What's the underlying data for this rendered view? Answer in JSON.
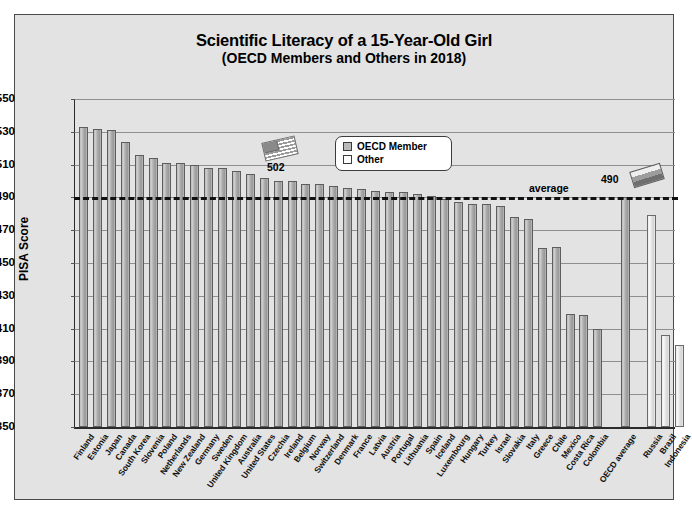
{
  "chart_data": {
    "type": "bar",
    "title": "Scientific Literacy of a 15-Year-Old Girl",
    "subtitle": "(OECD Members and Others in 2018)",
    "xlabel": "",
    "ylabel": "PISA Score",
    "ylim": [
      350,
      550
    ],
    "ytick_step": 20,
    "yticks": [
      550,
      530,
      510,
      490,
      470,
      450,
      430,
      410,
      390,
      370,
      350
    ],
    "grid": true,
    "legend_position": "top-center",
    "legend": [
      {
        "label": "OECD Member",
        "color": "#b9b9b9"
      },
      {
        "label": "Other",
        "color": "#ffffff"
      }
    ],
    "categories": [
      "Finland",
      "Estonia",
      "Japan",
      "Canada",
      "South Korea",
      "Slovenia",
      "Poland",
      "Netherlands",
      "New Zealand",
      "Germany",
      "Sweden",
      "United Kingdom",
      "Australia",
      "United States",
      "Czechia",
      "Ireland",
      "Belgium",
      "Norway",
      "Switzerland",
      "Denmark",
      "France",
      "Latvia",
      "Austria",
      "Portugal",
      "Lithuania",
      "Spain",
      "Iceland",
      "Luxembourg",
      "Hungary",
      "Turkey",
      "Israel",
      "Slovakia",
      "Italy",
      "Greece",
      "Chile",
      "Mexico",
      "Costa Rica",
      "Colombia",
      "OECD average",
      "Russia",
      "Brazil",
      "Indonesia"
    ],
    "values": [
      533,
      532,
      531,
      524,
      516,
      514,
      511,
      511,
      510,
      508,
      508,
      506,
      504,
      502,
      500,
      500,
      498,
      498,
      497,
      496,
      495,
      494,
      493,
      493,
      492,
      491,
      489,
      487,
      486,
      486,
      485,
      478,
      477,
      459,
      460,
      419,
      418,
      410,
      490,
      479,
      406,
      400
    ],
    "series_type": [
      "OECD Member",
      "OECD Member",
      "OECD Member",
      "OECD Member",
      "OECD Member",
      "OECD Member",
      "OECD Member",
      "OECD Member",
      "OECD Member",
      "OECD Member",
      "OECD Member",
      "OECD Member",
      "OECD Member",
      "OECD Member",
      "OECD Member",
      "OECD Member",
      "OECD Member",
      "OECD Member",
      "OECD Member",
      "OECD Member",
      "OECD Member",
      "OECD Member",
      "OECD Member",
      "OECD Member",
      "OECD Member",
      "OECD Member",
      "OECD Member",
      "OECD Member",
      "OECD Member",
      "OECD Member",
      "OECD Member",
      "OECD Member",
      "OECD Member",
      "OECD Member",
      "OECD Member",
      "OECD Member",
      "OECD Member",
      "OECD Member",
      "OECD Member",
      "Other",
      "Other",
      "Other"
    ],
    "annotations": [
      {
        "name": "average-line",
        "label": "average",
        "value": 490,
        "style": "dashed-horizontal"
      },
      {
        "name": "us-callout",
        "label": "502",
        "target": "United States",
        "icon": "us-flag-icon"
      },
      {
        "name": "oecd-average-callout",
        "label": "490",
        "target": "OECD average",
        "icon": "russia-flag-icon"
      }
    ]
  },
  "axis": {
    "y_title": "PISA Score"
  }
}
